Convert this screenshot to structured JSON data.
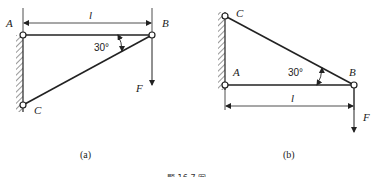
{
  "figure_a": {
    "caption": "(a)",
    "labels": {
      "A": "A",
      "B": "B",
      "C": "C",
      "F": "F",
      "length": "l"
    },
    "angle": "30°"
  },
  "figure_b": {
    "caption": "(b)",
    "labels": {
      "A": "A",
      "B": "B",
      "C": "C",
      "F": "F",
      "length": "l"
    },
    "angle": "30°"
  },
  "figure_caption": "题 16-7 图",
  "colors": {
    "line": "#222222",
    "background": "#ffffff"
  }
}
